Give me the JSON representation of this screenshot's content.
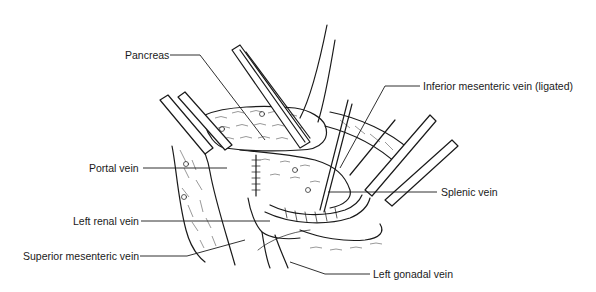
{
  "figure": {
    "type": "surgical-anatomy-illustration",
    "colors": {
      "ink": "#1a1a1a",
      "background": "#ffffff"
    },
    "labels": [
      {
        "id": "pancreas",
        "text": "Pancreas",
        "x": 125,
        "y": 49
      },
      {
        "id": "inferior-mesenteric-vein",
        "text": "Inferior mesenteric vein (ligated)",
        "x": 423,
        "y": 80
      },
      {
        "id": "portal-vein",
        "text": "Portal vein",
        "x": 89,
        "y": 163
      },
      {
        "id": "splenic-vein",
        "text": "Splenic vein",
        "x": 441,
        "y": 186
      },
      {
        "id": "left-renal-vein",
        "text": "Left renal vein",
        "x": 73,
        "y": 215
      },
      {
        "id": "superior-mesenteric-vein",
        "text": "Superior mesenteric vein",
        "x": 23,
        "y": 250
      },
      {
        "id": "left-gonadal-vein",
        "text": "Left gonadal vein",
        "x": 373,
        "y": 268
      }
    ]
  }
}
